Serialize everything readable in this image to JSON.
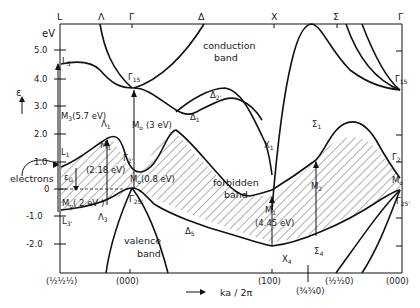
{
  "diagram": {
    "y_axis": {
      "unit": "eV",
      "symbol": "ε",
      "ticks": [
        "5.0",
        "4.0",
        "3.0",
        "2.0",
        "1.0",
        "0",
        "-1.0",
        "-2.0"
      ]
    },
    "x_axis": {
      "label": "ka / 2π",
      "arrow": "→",
      "k_points": [
        "(½½½)",
        "(000)",
        "(100)",
        "(¾¾0)",
        "(½½0)",
        "(000)"
      ]
    },
    "top_symmetry_labels": [
      "L",
      "Λ",
      "Γ",
      "Δ",
      "X",
      "Σ",
      "Γ"
    ],
    "regions": {
      "conduction": "conduction band",
      "conduction_line1": "conduction",
      "conduction_line2": "band",
      "forbidden_line1": "forbidden",
      "forbidden_line2": "band",
      "valence_line1": "valence",
      "valence_line2": "band"
    },
    "point_labels": {
      "L3": "L",
      "L3_sub": "3",
      "L1": "L",
      "L1_sub": "1",
      "L3p": "L",
      "L3p_sub": "3'",
      "G15": "Γ",
      "G15_sub": "15",
      "G15_right": "Γ",
      "G15_right_sub": "15",
      "G2p": "Γ",
      "G2p_sub": "2'",
      "G25p": "Γ",
      "G25p_sub": "25'",
      "G25p_right": "Γ",
      "G25p_right_sub": "25'",
      "G2_right": "Γ",
      "G2_right_sub": "2",
      "Lambda1": "Λ",
      "Lambda1_sub": "1",
      "Lambda3": "Λ",
      "Lambda3_sub": "3",
      "Delta1": "Δ",
      "Delta1_sub": "1",
      "Delta2p": "Δ",
      "Delta2p_sub": "2'",
      "Delta5": "Δ",
      "Delta5_sub": "5",
      "X1": "X",
      "X1_sub": "1",
      "X4": "X",
      "X4_sub": "4",
      "Sigma1": "Σ",
      "Sigma1_sub": "1",
      "Sigma4": "Σ",
      "Sigma4_sub": "4"
    },
    "transition_labels": {
      "M3": "M",
      "M3_sub": "3",
      "M3_val": "(5.7 eV)",
      "M1_left": "M",
      "M1_left_sub": "1",
      "M1_left_val": "(2.18 eV)",
      "M0_left": "M",
      "M0_left_sub": "o",
      "M0_left_val": "( 2 eV )",
      "M0_3eV": "M",
      "M0_3eV_sub": "o",
      "M0_3eV_val": "(3 eV)",
      "M0_08": "M",
      "M0_08_sub": "o",
      "M0_08_val": "(0.8 eV)",
      "M1_right": "M",
      "M1_right_sub": "1",
      "M1_right_val": "(4.45 eV)",
      "M2": "M",
      "M2_sub": "2",
      "M0_right": "M",
      "M0_right_sub": "o"
    },
    "annotations": {
      "electrons": "electrons",
      "gap": "ε",
      "gap_sub": "G"
    }
  }
}
